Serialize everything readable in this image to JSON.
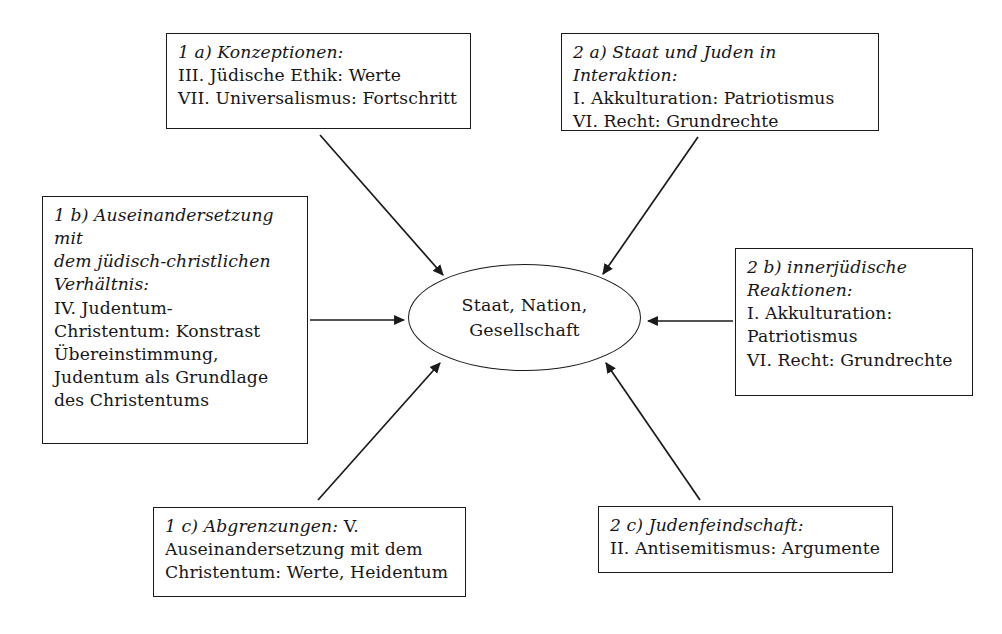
{
  "diagram": {
    "center": {
      "name": "Staat, Nation, Gesellschaft",
      "line1": "Staat, Nation,",
      "line2": "Gesellschaft"
    },
    "boxes": [
      {
        "id": "1a",
        "header": "1 a) Konzeptionen:",
        "lines": [
          "III. Jüdische Ethik: Werte",
          "VII. Universalismus: Fortschritt"
        ]
      },
      {
        "id": "2a",
        "header": "2 a) Staat und Juden in Interaktion:",
        "lines": [
          "I. Akkulturation: Patriotismus",
          "VI. Recht: Grundrechte"
        ]
      },
      {
        "id": "1b",
        "header": "1 b) Auseinandersetzung mit dem jüdisch-christlichen Verhältnis:",
        "header_line1": "1 b) Auseinandersetzung mit",
        "header_line2": "dem jüdisch-christlichen",
        "header_line3": "Verhältnis:",
        "lines": [
          "IV. Judentum-",
          "Christentum: Konstrast",
          "Übereinstimmung,",
          "Judentum als Grundlage",
          "des Christentums"
        ]
      },
      {
        "id": "2b",
        "header": "2 b) innerjüdische Reaktionen:",
        "header_line1": "2 b) innerjüdische",
        "header_line2": "Reaktionen:",
        "lines": [
          "I. Akkulturation:",
          "Patriotismus",
          "VI. Recht: Grundrechte"
        ]
      },
      {
        "id": "1c",
        "header": "1 c) Abgrenzungen:",
        "header_tail": " V.",
        "lines": [
          "Auseinandersetzung mit dem",
          "Christentum: Werte, Heidentum"
        ]
      },
      {
        "id": "2c",
        "header": "2 c) Judenfeindschaft:",
        "lines": [
          "II. Antisemitismus: Argumente"
        ]
      }
    ],
    "edges": [
      {
        "from": "1a",
        "to": "center",
        "direction": "to-center"
      },
      {
        "from": "2a",
        "to": "center",
        "direction": "to-center"
      },
      {
        "from": "1b",
        "to": "center",
        "direction": "to-center"
      },
      {
        "from": "2b",
        "to": "center",
        "direction": "to-center"
      },
      {
        "from": "1c",
        "to": "center",
        "direction": "to-center"
      },
      {
        "from": "2c",
        "to": "center",
        "direction": "to-center"
      }
    ],
    "colors": {
      "stroke": "#1a1a1a",
      "text": "#16161a",
      "background": "#ffffff"
    }
  }
}
